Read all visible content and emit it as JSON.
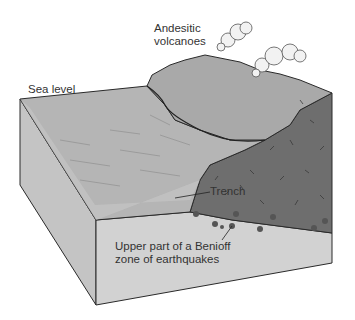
{
  "figure": {
    "labels": {
      "volcanoes_line1": "Andesitic",
      "volcanoes_line2": "volcanoes",
      "sea_level": "Sea level",
      "trench": "Trench",
      "benioff_line1": "Upper part of a Benioff",
      "benioff_line2": "zone of earthquakes"
    },
    "colors": {
      "ocean_surface": "#b8b8b8",
      "ocean_front": "#d0d0d0",
      "land_top": "#a9a9a9",
      "continental_crust": "#6e6e6e",
      "mantle_front": "#cfcfcf",
      "left_side": "#c4c4c4",
      "outline": "#2a2a2a",
      "earthquake": "#555555",
      "cloud": "#f2f2f2"
    },
    "earthquake_count": 9
  }
}
